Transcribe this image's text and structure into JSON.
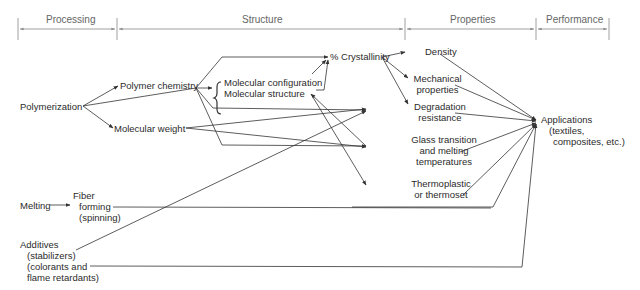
{
  "stages": [
    {
      "id": "processing",
      "label": "Processing"
    },
    {
      "id": "structure",
      "label": "Structure"
    },
    {
      "id": "properties",
      "label": "Properties"
    },
    {
      "id": "performance",
      "label": "Performance"
    }
  ],
  "nodes": {
    "polymerization": "Polymerization",
    "polymer_chemistry": "Polymer chemistry",
    "molecular_weight": "Molecular weight",
    "molecular_configuration": "Molecular configuration",
    "molecular_structure": "Molecular structure",
    "crystallinity": "% Crystallinity",
    "density": "Density",
    "mechanical_1": "Mechanical",
    "mechanical_2": "properties",
    "degradation_1": "Degradation",
    "degradation_2": "resistance",
    "glass_1": "Glass transition",
    "glass_2": "and melting",
    "glass_3": "temperatures",
    "thermo_1": "Thermoplastic",
    "thermo_2": "or thermoset",
    "applications_1": "Applications",
    "applications_2": "(textiles,",
    "applications_3": "composites, etc.)",
    "melting": "Melting",
    "fiber_1": "Fiber",
    "fiber_2": "forming",
    "fiber_3": "(spinning)",
    "additives_1": "Additives",
    "additives_2": "(stabilizers)",
    "additives_3": "(colorants and",
    "additives_4": "flame retardants)"
  },
  "edges": [
    [
      "Polymerization",
      "Polymer chemistry"
    ],
    [
      "Polymerization",
      "Molecular weight"
    ],
    [
      "Polymerization",
      "Molecular configuration / structure"
    ],
    [
      "Polymer chemistry",
      "Molecular configuration / structure"
    ],
    [
      "Polymer chemistry",
      "% Crystallinity"
    ],
    [
      "Polymer chemistry",
      "Degradation resistance"
    ],
    [
      "Polymer chemistry",
      "Glass transition and melting temperatures"
    ],
    [
      "Molecular configuration",
      "% Crystallinity"
    ],
    [
      "Molecular structure",
      "% Crystallinity"
    ],
    [
      "Molecular structure",
      "Glass transition and melting temperatures"
    ],
    [
      "Molecular structure",
      "Thermoplastic or thermoset"
    ],
    [
      "Molecular weight",
      "Degradation resistance"
    ],
    [
      "Molecular weight",
      "Glass transition and melting temperatures"
    ],
    [
      "% Crystallinity",
      "Density"
    ],
    [
      "% Crystallinity",
      "Mechanical properties"
    ],
    [
      "% Crystallinity",
      "Degradation resistance"
    ],
    [
      "Density",
      "Applications"
    ],
    [
      "Mechanical properties",
      "Applications"
    ],
    [
      "Degradation resistance",
      "Applications"
    ],
    [
      "Glass transition and melting temperatures",
      "Applications"
    ],
    [
      "Thermoplastic or thermoset",
      "Applications"
    ],
    [
      "Melting",
      "Fiber forming (spinning)"
    ],
    [
      "Fiber forming (spinning)",
      "Applications"
    ],
    [
      "Additives",
      "Degradation resistance"
    ],
    [
      "Additives",
      "Applications"
    ]
  ]
}
